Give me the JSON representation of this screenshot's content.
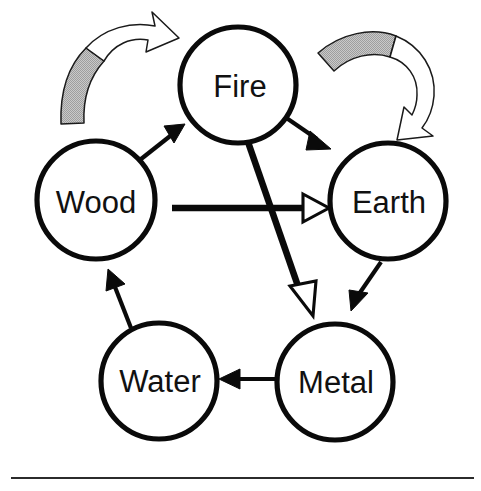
{
  "diagram": {
    "nodes": [
      {
        "id": "fire",
        "label": "Fire",
        "cx": 238,
        "cy": 85,
        "r": 58
      },
      {
        "id": "wood",
        "label": "Wood",
        "cx": 96,
        "cy": 200,
        "r": 59
      },
      {
        "id": "earth",
        "label": "Earth",
        "cx": 388,
        "cy": 201,
        "r": 58
      },
      {
        "id": "water",
        "label": "Water",
        "cx": 159,
        "cy": 381,
        "r": 58
      },
      {
        "id": "metal",
        "label": "Metal",
        "cx": 335,
        "cy": 382,
        "r": 58
      }
    ],
    "generating_arrows": [
      {
        "id": "wood-to-fire",
        "from": "Wood",
        "to": "Fire",
        "head": "solid-black"
      },
      {
        "id": "fire-to-earth",
        "from": "Fire",
        "to": "Earth",
        "head": "solid-black"
      },
      {
        "id": "earth-to-metal",
        "from": "Earth",
        "to": "Metal",
        "head": "solid-black"
      },
      {
        "id": "metal-to-water",
        "from": "Metal",
        "to": "Water",
        "head": "solid-black"
      },
      {
        "id": "water-to-wood",
        "from": "Water",
        "to": "Wood",
        "head": "solid-black"
      }
    ],
    "controlling_arrows": [
      {
        "id": "wood-to-earth",
        "from": "Wood",
        "to": "Earth",
        "head": "hollow-white"
      },
      {
        "id": "fire-to-metal",
        "from": "Fire",
        "to": "Metal",
        "head": "hollow-white"
      }
    ],
    "cycle_arrows": [
      {
        "id": "left-cycle-arrow",
        "direction": "clockwise",
        "position": "top-left"
      },
      {
        "id": "right-cycle-arrow",
        "direction": "clockwise",
        "position": "top-right"
      }
    ],
    "footer_rule": {
      "x1": 11,
      "x2": 474,
      "y": 478
    }
  },
  "colors": {
    "stroke": "#0a0a0a",
    "node_fill": "#ffffff",
    "label_text": "#111111",
    "cycle_tail_gray": "#b9b9b9",
    "cycle_head_white": "#ffffff",
    "cycle_outline": "#1a1a1a",
    "hollow_head_fill": "#ffffff",
    "footer_rule": "#2b2b2b",
    "page_background": "#ffffff"
  }
}
